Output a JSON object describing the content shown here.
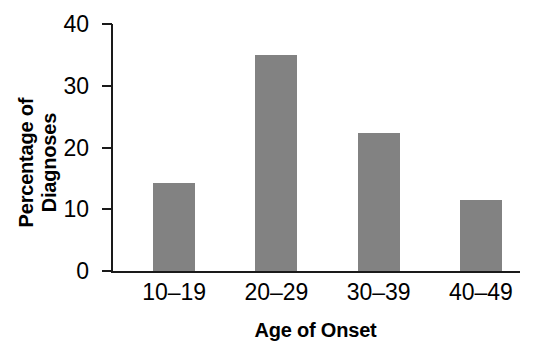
{
  "chart_data": {
    "type": "bar",
    "title": "",
    "subtitle": "",
    "categories": [
      "10–19",
      "20–29",
      "30–39",
      "40–49"
    ],
    "values": [
      14.2,
      35.0,
      22.3,
      11.5
    ],
    "xlabel": "Age of Onset",
    "ylabel": "Percentage of Diagnoses",
    "ylabel_lines": [
      "Percentage of",
      "Diagnoses"
    ],
    "ylim": [
      0,
      40
    ],
    "yticks": [
      0,
      10,
      20,
      30,
      40
    ],
    "ytick_labels": [
      "0",
      "10",
      "20",
      "30",
      "40"
    ],
    "grid": false,
    "legend": false,
    "legend_position": "none",
    "bar_color": "#828282",
    "axis_color": "#1a1a1a",
    "background_color": "#ffffff",
    "text_color": "#000000"
  }
}
